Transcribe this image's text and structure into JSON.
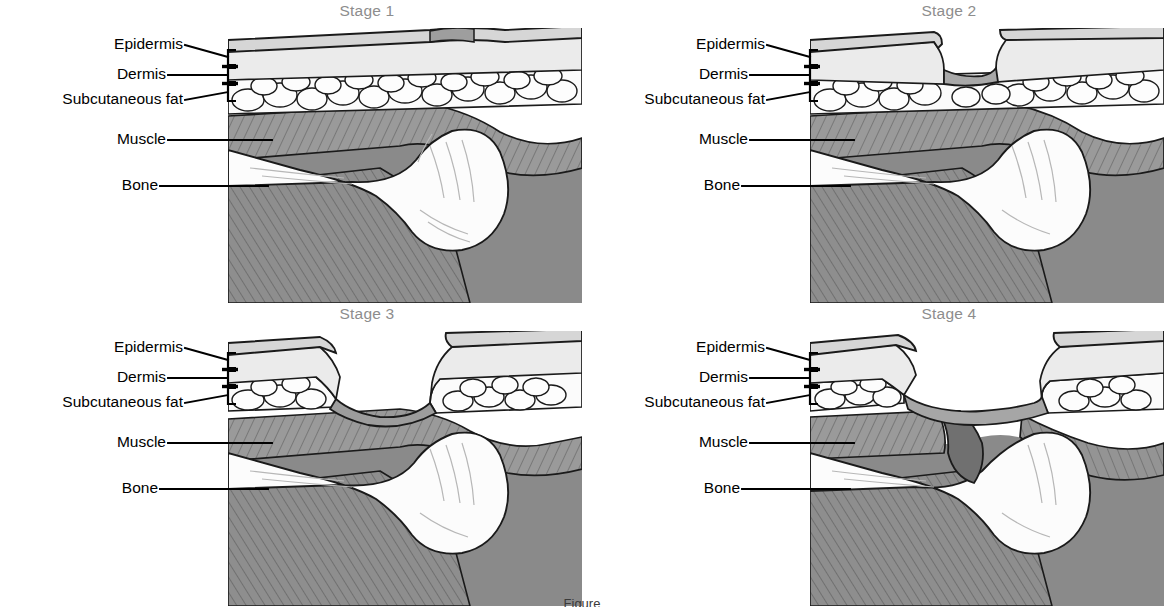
{
  "figure": {
    "caption": "Figure",
    "background_color": "#ffffff",
    "title_color": "#8d8d8d",
    "label_color": "#000000",
    "layout": "2x2 grid of cross-sectional skin illustrations"
  },
  "anatomy_labels": {
    "epidermis": "Epidermis",
    "dermis": "Dermis",
    "subcutaneous_fat": "Subcutaneous fat",
    "muscle": "Muscle",
    "bone": "Bone"
  },
  "palette": {
    "epidermis_fill": "#d6d6d6",
    "dermis_fill": "#ebebeb",
    "fat_fill": "#fbfbfb",
    "muscle_fill": "#9a9a9a",
    "muscle_dark_fill": "#7e7e7e",
    "bone_fill": "#fcfcfc",
    "shadow_fill": "#868686",
    "deep_shadow_fill": "#6f6f6f",
    "outline": "#1a1a1a",
    "wound_fill": "#a8a8a8"
  },
  "panels": [
    {
      "id": "stage-1",
      "title": "Stage 1",
      "row": 0,
      "col": 0,
      "description": "Intact skin with non-blanchable redness; all layers continuous over the bony prominence",
      "skin_intact": true,
      "wound_depth": "none",
      "labels": [
        "Epidermis",
        "Dermis",
        "Subcutaneous fat",
        "Muscle",
        "Bone"
      ]
    },
    {
      "id": "stage-2",
      "title": "Stage 2",
      "row": 0,
      "col": 1,
      "description": "Partial thickness loss of dermis; shallow open ulcer through epidermis and dermis",
      "skin_intact": false,
      "wound_depth": "dermis",
      "labels": [
        "Epidermis",
        "Dermis",
        "Subcutaneous fat",
        "Muscle",
        "Bone"
      ]
    },
    {
      "id": "stage-3",
      "title": "Stage 3",
      "row": 1,
      "col": 0,
      "description": "Full thickness tissue loss; subcutaneous fat may be visible, wound extends to fascia over muscle",
      "skin_intact": false,
      "wound_depth": "subcutaneous-fat",
      "labels": [
        "Epidermis",
        "Dermis",
        "Subcutaneous fat",
        "Muscle",
        "Bone"
      ]
    },
    {
      "id": "stage-4",
      "title": "Stage 4",
      "row": 1,
      "col": 1,
      "description": "Full thickness tissue loss with exposed bone, tendon or muscle; deep undermining cavity",
      "skin_intact": false,
      "wound_depth": "bone",
      "labels": [
        "Epidermis",
        "Dermis",
        "Subcutaneous fat",
        "Muscle",
        "Bone"
      ]
    }
  ]
}
